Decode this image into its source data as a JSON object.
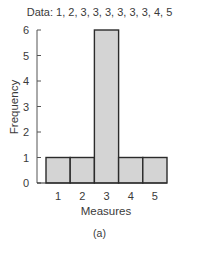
{
  "chart_data": {
    "type": "bar",
    "title": "Data: 1, 2, 3, 3, 3, 3, 3, 3, 4, 5",
    "categories": [
      "1",
      "2",
      "3",
      "4",
      "5"
    ],
    "values": [
      1,
      1,
      6,
      1,
      1
    ],
    "xlabel": "Measures",
    "ylabel": "Frequency",
    "ylim": [
      0,
      6
    ],
    "yticks": [
      0,
      1,
      2,
      3,
      4,
      5,
      6
    ],
    "grid": false,
    "legend": null,
    "caption": "(a)",
    "bar_fill": "#d4d4d4",
    "bar_stroke": "#2b2b2b"
  }
}
